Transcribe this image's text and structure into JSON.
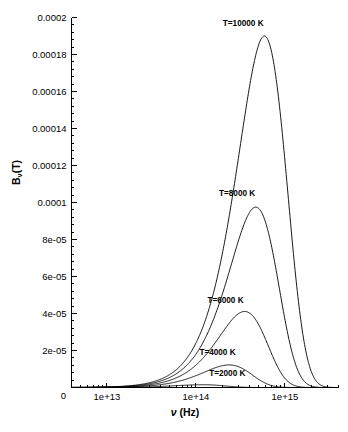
{
  "figure": {
    "kind": "scientific-plot",
    "background_color": "#ffffff",
    "line_color": "#000000"
  },
  "chart_data": {
    "type": "line",
    "title": "",
    "xlabel": "ν (Hz)",
    "ylabel": "Bν(T)",
    "ylabel_base": "B",
    "ylabel_sub": "ν",
    "ylabel_tail": "(T)",
    "xscale": "log",
    "yscale": "linear",
    "xlim": [
      4000000000000,
      4000000000000000
    ],
    "ylim": [
      0,
      0.0002
    ],
    "grid": false,
    "legend": "inline-curve-labels",
    "x_major_ticks": [
      10000000000000,
      100000000000000,
      1000000000000000
    ],
    "x_major_tick_labels": [
      "1e+13",
      "1e+14",
      "1e+15"
    ],
    "y_major_ticks": [
      0,
      2e-05,
      4e-05,
      6e-05,
      8e-05,
      0.0001,
      0.00012,
      0.00014,
      0.00016,
      0.00018,
      0.0002
    ],
    "y_major_tick_labels": [
      "0",
      "2e-05",
      "4e-05",
      "6e-05",
      "8e-05",
      "0.0001",
      "0.00012",
      "0.00014",
      "0.00016",
      "0.00018",
      "0.0002"
    ],
    "origin_label": "0",
    "physics": {
      "law": "planck-spectral-radiance-frequency",
      "h": 6.62607015e-34,
      "c": 299792458,
      "k": 1.380649e-23
    },
    "series": [
      {
        "name": "T=10000 K",
        "temperature_K": 10000,
        "label": "T=10000 K",
        "label_x_hz": 340000000000000,
        "label_y": 0.0001955,
        "peak_x_hz": 587000000000000,
        "peak_y": 0.00019
      },
      {
        "name": "T=8000 K",
        "temperature_K": 8000,
        "label": "T=8000 K",
        "label_x_hz": 290000000000000,
        "label_y": 0.0001035,
        "peak_x_hz": 470000000000000,
        "peak_y": 9.75e-05
      },
      {
        "name": "T=6000 K",
        "temperature_K": 6000,
        "label": "T=6000 K",
        "label_x_hz": 215000000000000,
        "label_y": 4.55e-05,
        "peak_x_hz": 352000000000000,
        "peak_y": 4.11e-05
      },
      {
        "name": "T=4000 K",
        "temperature_K": 4000,
        "label": "T=4000 K",
        "label_x_hz": 175000000000000,
        "label_y": 1.75e-05,
        "peak_x_hz": 235000000000000,
        "peak_y": 1.22e-05
      },
      {
        "name": "T=2000 K",
        "temperature_K": 2000,
        "label": "T=2000 K",
        "label_x_hz": 225000000000000,
        "label_y": 6.5e-06,
        "peak_x_hz": 117000000000000,
        "peak_y": 1.5e-06
      }
    ]
  }
}
